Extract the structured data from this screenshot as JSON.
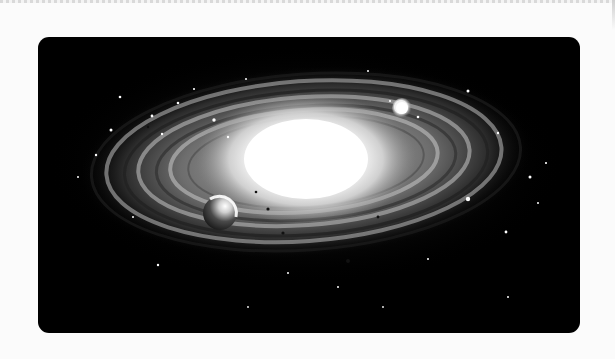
{
  "image": {
    "subject": "spiral galaxy illustration",
    "description": "Black-and-white spiral galaxy with a bright white core, swirling arms, scattered stars, and two planets",
    "colors": {
      "page_background": "#fbfbfb",
      "frame_background": "#000000",
      "core": "#ffffff"
    },
    "elements": {
      "planet_left": "planet near lower-left of galaxy arms",
      "planet_right": "bright star/planet near upper-right of galaxy"
    }
  }
}
